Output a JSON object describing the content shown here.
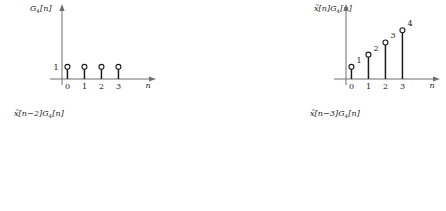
{
  "figure": {
    "background_color": "#ffffff",
    "stem_color": "#1a1a1a",
    "axis_color": "#6f6f6f",
    "marker_fill": "#ffffff",
    "x_axis_label": "n",
    "x_ticks": [
      "0",
      "1",
      "2",
      "3"
    ]
  },
  "chart_data": [
    {
      "type": "stem",
      "title": "G4[n]",
      "title_parts": {
        "base": "G",
        "sub": "4",
        "arg": "[n]",
        "prefix": ""
      },
      "x": [
        0,
        1,
        2,
        3
      ],
      "values": [
        1,
        1,
        1,
        1
      ],
      "point_labels": [
        "",
        "",
        "",
        ""
      ],
      "y_axis_label": "1",
      "xlabel": "n",
      "ylabel": "",
      "xlim": [
        -0.4,
        4.0
      ],
      "ylim": [
        0,
        4.6
      ],
      "grid": false,
      "legend": "none"
    },
    {
      "type": "stem",
      "title": "x̃[n]G4[n]",
      "title_parts": {
        "base": "G",
        "sub": "4",
        "arg": "[n]",
        "prefix": "x̃[n]"
      },
      "x": [
        0,
        1,
        2,
        3
      ],
      "values": [
        1,
        2,
        3,
        4
      ],
      "point_labels": [
        "1",
        "2",
        "3",
        "4"
      ],
      "y_axis_label": "",
      "xlabel": "n",
      "ylabel": "",
      "xlim": [
        -0.4,
        4.0
      ],
      "ylim": [
        0,
        4.6
      ],
      "grid": false,
      "legend": "none"
    },
    {
      "type": "stem",
      "title": "x̃[n−1]G4[n]",
      "title_parts": {
        "base": "G",
        "sub": "4",
        "arg": "[n]",
        "prefix": "x̃[n−1]"
      },
      "x": [
        0,
        1,
        2,
        3
      ],
      "values": [
        4,
        1,
        2,
        3
      ],
      "point_labels": [
        "4",
        "1",
        "2",
        "3"
      ],
      "y_axis_label": "",
      "xlabel": "n",
      "ylabel": "",
      "xlim": [
        -0.4,
        4.0
      ],
      "ylim": [
        0,
        4.6
      ],
      "grid": false,
      "legend": "none"
    },
    {
      "type": "stem",
      "title": "x̃[n−2]G4[n]",
      "title_parts": {
        "base": "G",
        "sub": "4",
        "arg": "[n]",
        "prefix": "x̃[n−2]"
      },
      "x": [
        0,
        1,
        2,
        3
      ],
      "values": [
        3,
        4,
        1,
        2
      ],
      "point_labels": [
        "3",
        "4",
        "1",
        "2"
      ],
      "y_axis_label": "",
      "xlabel": "n",
      "ylabel": "",
      "xlim": [
        -0.4,
        4.0
      ],
      "ylim": [
        0,
        4.6
      ],
      "grid": false,
      "legend": "none"
    },
    {
      "type": "stem",
      "title": "x̃[n−3]G4[n]",
      "title_parts": {
        "base": "G",
        "sub": "4",
        "arg": "[n]",
        "prefix": "x̃[n−3]"
      },
      "x": [
        0,
        1,
        2,
        3
      ],
      "values": [
        2,
        3,
        4,
        1
      ],
      "point_labels": [
        "2",
        "3",
        "4",
        "1"
      ],
      "y_axis_label": "",
      "xlabel": "n",
      "ylabel": "",
      "xlim": [
        -0.4,
        4.0
      ],
      "ylim": [
        0,
        4.6
      ],
      "grid": false,
      "legend": "none"
    },
    {
      "type": "stem",
      "title": "x̃[n+1]G4[n]",
      "title_parts": {
        "base": "G",
        "sub": "4",
        "arg": "[n]",
        "prefix": "x̃[n+1]"
      },
      "x": [
        0,
        1,
        2,
        3
      ],
      "values": [
        2,
        3,
        4,
        1
      ],
      "point_labels": [
        "2",
        "3",
        "4",
        "1"
      ],
      "y_axis_label": "",
      "xlabel": "n",
      "ylabel": "",
      "xlim": [
        -0.4,
        4.0
      ],
      "ylim": [
        0,
        4.6
      ],
      "grid": false,
      "legend": "none"
    }
  ]
}
